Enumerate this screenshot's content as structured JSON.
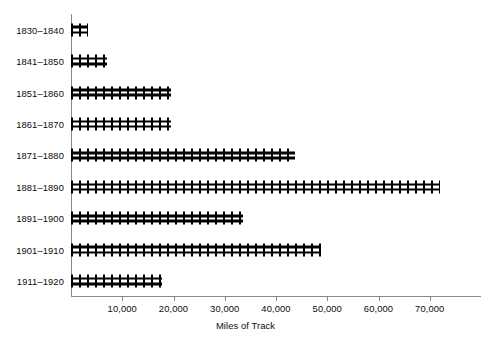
{
  "chart_data": {
    "type": "bar",
    "orientation": "horizontal",
    "title": "",
    "xlabel": "Miles of Track",
    "ylabel": "",
    "categories": [
      "1830–1840",
      "1841–1850",
      "1851–1860",
      "1861–1870",
      "1871–1880",
      "1881–1890",
      "1891–1900",
      "1901–1910",
      "1911–1920"
    ],
    "values": [
      3300,
      7000,
      19500,
      19500,
      43800,
      72000,
      33500,
      48800,
      17800
    ],
    "xlim": [
      0,
      80000
    ],
    "xticks": [
      10000,
      20000,
      30000,
      40000,
      50000,
      60000,
      70000
    ],
    "xtick_labels": [
      "10,000",
      "20,000",
      "30,000",
      "40,000",
      "50,000",
      "60,000",
      "70,000"
    ],
    "grid": false,
    "legend": false,
    "bar_style": "railroad-track",
    "colors": {
      "bar": "#000000",
      "axis": "#8a8a8a",
      "text": "#0c0c0c",
      "background": "#ffffff"
    }
  }
}
